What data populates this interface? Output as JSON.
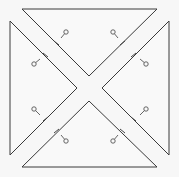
{
  "diagram": {
    "title": "",
    "width": 179,
    "height": 177,
    "colors": {
      "background": "#f7f7f7",
      "fill": "#f9f9f9",
      "stroke": "#3a3a3a",
      "marker": "#555555"
    },
    "pieces": [
      {
        "id": "top",
        "points": [
          [
            22,
            9
          ],
          [
            157,
            9
          ],
          [
            89,
            76
          ]
        ]
      },
      {
        "id": "left",
        "points": [
          [
            10,
            21
          ],
          [
            10,
            155
          ],
          [
            77,
            88
          ]
        ]
      },
      {
        "id": "right",
        "points": [
          [
            169,
            21
          ],
          [
            169,
            155
          ],
          [
            102,
            88
          ]
        ]
      },
      {
        "id": "bottom",
        "points": [
          [
            22,
            167
          ],
          [
            157,
            167
          ],
          [
            89,
            101
          ]
        ]
      }
    ],
    "ticks": [
      {
        "from": [
          54,
          41
        ],
        "to": [
          59,
          45
        ]
      },
      {
        "from": [
          43,
          53
        ],
        "to": [
          48,
          57
        ]
      },
      {
        "from": [
          120,
          45
        ],
        "to": [
          125,
          41
        ]
      },
      {
        "from": [
          131,
          57
        ],
        "to": [
          136,
          53
        ]
      },
      {
        "from": [
          43,
          121
        ],
        "to": [
          48,
          117
        ]
      },
      {
        "from": [
          54,
          133
        ],
        "to": [
          59,
          129
        ]
      },
      {
        "from": [
          131,
          117
        ],
        "to": [
          136,
          121
        ]
      },
      {
        "from": [
          120,
          129
        ],
        "to": [
          125,
          133
        ]
      }
    ],
    "markers": [
      {
        "circle": [
          66,
          32
        ],
        "stem_to": [
          61,
          38
        ]
      },
      {
        "circle": [
          34,
          64
        ],
        "stem_to": [
          40,
          59
        ]
      },
      {
        "circle": [
          113,
          32
        ],
        "stem_to": [
          118,
          38
        ]
      },
      {
        "circle": [
          146,
          64
        ],
        "stem_to": [
          140,
          59
        ]
      },
      {
        "circle": [
          34,
          109
        ],
        "stem_to": [
          40,
          115
        ]
      },
      {
        "circle": [
          66,
          141
        ],
        "stem_to": [
          61,
          135
        ]
      },
      {
        "circle": [
          146,
          109
        ],
        "stem_to": [
          140,
          115
        ]
      },
      {
        "circle": [
          113,
          141
        ],
        "stem_to": [
          118,
          135
        ]
      }
    ],
    "marker_radius": 2.2
  }
}
